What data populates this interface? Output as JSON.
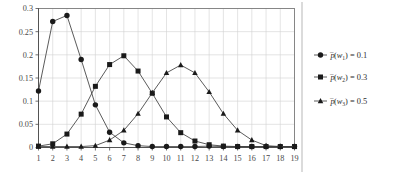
{
  "chart_data": {
    "type": "line",
    "title": "",
    "xlabel": "",
    "ylabel": "",
    "x": [
      1,
      2,
      3,
      4,
      5,
      6,
      7,
      8,
      9,
      10,
      11,
      12,
      13,
      14,
      15,
      16,
      17,
      18,
      19
    ],
    "xtick_labels": [
      "1",
      "2",
      "3",
      "4",
      "5",
      "6",
      "7",
      "8",
      "9",
      "10",
      "11",
      "12",
      "13",
      "14",
      "15",
      "16",
      "17",
      "18",
      "19"
    ],
    "ytick_labels": [
      "0",
      "0.05",
      "0.1",
      "0.15",
      "0.2",
      "0.25",
      "0.3"
    ],
    "ytick_values": [
      0,
      0.05,
      0.1,
      0.15,
      0.2,
      0.25,
      0.3
    ],
    "xlim": [
      1,
      19
    ],
    "ylim": [
      0,
      0.3
    ],
    "grid": true,
    "legend_position": "right",
    "series": [
      {
        "name": "p_bar(w1) = 0.1",
        "marker": "circle",
        "values": [
          0.122,
          0.272,
          0.285,
          0.19,
          0.092,
          0.033,
          0.01,
          0.004,
          0.002,
          0.002,
          0.002,
          0.002,
          0.003,
          0.002,
          0.002,
          0.002,
          0.002,
          0.002,
          0.002
        ]
      },
      {
        "name": "p_bar(w2) = 0.3",
        "marker": "square",
        "values": [
          0.003,
          0.008,
          0.029,
          0.072,
          0.132,
          0.179,
          0.198,
          0.165,
          0.117,
          0.066,
          0.032,
          0.014,
          0.006,
          0.003,
          0.002,
          0.002,
          0.002,
          0.002,
          0.002
        ]
      },
      {
        "name": "p_bar(w3) = 0.5",
        "marker": "triangle",
        "values": [
          0.002,
          0.002,
          0.002,
          0.002,
          0.004,
          0.016,
          0.037,
          0.073,
          0.118,
          0.161,
          0.178,
          0.161,
          0.12,
          0.073,
          0.037,
          0.016,
          0.004,
          0.002,
          0.002
        ]
      }
    ]
  },
  "legend": {
    "entries": [
      {
        "marker": "circle",
        "symbol": "p",
        "open_paren": "(",
        "var": "w",
        "subscript": "1",
        "close_paren": ")",
        "equals": " = 0.1",
        "full_label": "p̄(w₁) = 0.1"
      },
      {
        "marker": "square",
        "symbol": "p",
        "open_paren": "(",
        "var": "w",
        "subscript": "2",
        "close_paren": ")",
        "equals": " = 0.3",
        "full_label": "p̄(w₂) = 0.3"
      },
      {
        "marker": "triangle",
        "symbol": "p",
        "open_paren": "(",
        "var": "w",
        "subscript": "3",
        "close_paren": ")",
        "equals": " = 0.5",
        "full_label": "p̄(w₃) = 0.5"
      }
    ]
  },
  "colors": {
    "line": "#3d3d3d",
    "marker": "#1a1a1a",
    "grid": "#d2d2d2",
    "axis": "#4d4d4d",
    "frame": "#6f6f6f",
    "text": "#3a3a3a",
    "background": "#ffffff"
  }
}
